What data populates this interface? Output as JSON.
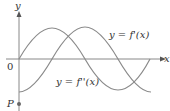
{
  "figure": {
    "axis_x_label": "x",
    "axis_y_label": "y",
    "origin_label": "0",
    "point_label": "P",
    "curves": [
      {
        "name": "first-derivative",
        "label": "y = f'(x)",
        "color": "#7a7a7a"
      },
      {
        "name": "second-derivative",
        "label": "y = f''(x)",
        "color": "#7a7a7a"
      }
    ]
  }
}
